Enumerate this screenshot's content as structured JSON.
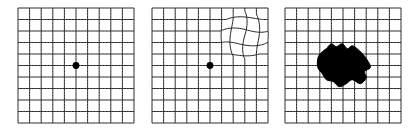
{
  "figure": {
    "panels": [
      {
        "id": "normal",
        "x": 18,
        "y": 8,
        "width": 116,
        "height": 115,
        "cols": 10,
        "rows": 10,
        "dot": {
          "col": 5,
          "row": 5,
          "radius": 3.4
        }
      },
      {
        "id": "metamorphopsia",
        "x": 152,
        "y": 8,
        "width": 116,
        "height": 115,
        "cols": 10,
        "rows": 10,
        "dot": {
          "col": 5,
          "row": 5,
          "radius": 3.4
        },
        "distortion": {
          "cx": 92.5,
          "cy": 27,
          "radius": 24,
          "swirl": 0.3,
          "bulge": 0.45
        }
      },
      {
        "id": "scotoma",
        "x": 285,
        "y": 8,
        "width": 116,
        "height": 115,
        "cols": 10,
        "rows": 10,
        "blob": [
          [
            32.3,
            55.7
          ],
          [
            33.3,
            48.7
          ],
          [
            37.3,
            43.7
          ],
          [
            41.3,
            40.7
          ],
          [
            46.3,
            35.7
          ],
          [
            51.3,
            38.7
          ],
          [
            57.3,
            35.7
          ],
          [
            62.3,
            40.7
          ],
          [
            67.3,
            37.7
          ],
          [
            73.3,
            41.7
          ],
          [
            78.3,
            46.7
          ],
          [
            83.3,
            53.7
          ],
          [
            85.3,
            59.7
          ],
          [
            79.3,
            63.7
          ],
          [
            81.3,
            69.7
          ],
          [
            75.3,
            75.7
          ],
          [
            67.3,
            71.7
          ],
          [
            61.3,
            75.7
          ],
          [
            54.3,
            78.7
          ],
          [
            48.3,
            73.7
          ],
          [
            41.3,
            71.7
          ],
          [
            37.3,
            65.7
          ],
          [
            33.3,
            60.7
          ]
        ]
      }
    ]
  },
  "colors": {
    "background": "#ffffff",
    "grid_line": "#242424",
    "dot": "#000000",
    "scotoma": "#000000"
  }
}
